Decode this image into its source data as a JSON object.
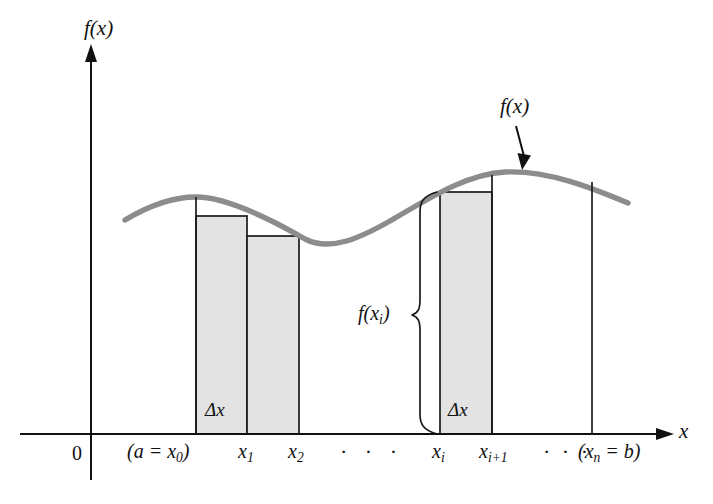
{
  "figure": {
    "width": 713,
    "height": 504,
    "background": "#ffffff"
  },
  "colors": {
    "curve": "#8c8c8c",
    "axis": "#111111",
    "rect_fill": "#e2e2e2",
    "rect_stroke": "#1a1a1a",
    "text": "#111111"
  },
  "axes": {
    "y_axis_label": "f(x)",
    "x_axis_label": "x",
    "origin_label": "0",
    "x_axis_y": 434,
    "y_axis_x": 91,
    "x_axis_start": 20,
    "x_axis_end": 672,
    "y_axis_top": 44,
    "y_axis_bottom": 480
  },
  "annotations": {
    "curve_label": "f(x)",
    "height_label_prefix": "f(x",
    "height_label_sub": "i",
    "height_label_suffix": ")",
    "delta_x_label_left": "Δx",
    "delta_x_label_right": "Δx"
  },
  "tick_labels": [
    {
      "id": "a-x0",
      "text_pre": "(a = x",
      "sub": "0",
      "text_post": ")",
      "x": 127
    },
    {
      "id": "x1",
      "text_pre": "x",
      "sub": "1",
      "text_post": "",
      "x": 238
    },
    {
      "id": "x2",
      "text_pre": "x",
      "sub": "2",
      "text_post": "",
      "x": 288
    },
    {
      "id": "dots-mid",
      "text_pre": "· · ·",
      "sub": "",
      "text_post": "",
      "x": 340
    },
    {
      "id": "xi",
      "text_pre": "x",
      "sub": "i",
      "text_post": "",
      "x": 432
    },
    {
      "id": "xi-plus-1",
      "text_pre": "x",
      "sub": "i+1",
      "text_post": "",
      "x": 479
    },
    {
      "id": "dots-right",
      "text_pre": "· · ·",
      "sub": "",
      "text_post": "",
      "x": 543
    },
    {
      "id": "xn-b",
      "text_pre": "(x",
      "sub": "n",
      "text_post": " = b)",
      "x": 578
    }
  ],
  "chart_data": {
    "type": "area",
    "xlabel": "x",
    "ylabel": "f(x)",
    "grid": false,
    "legend": "none",
    "curve_description": "Smooth wave: rises to a local maximum near x1, dips to a local minimum between x2 and xi, then rises to a global maximum near xi+1 and falls off to the right edge",
    "curve_points_px": [
      [
        125,
        220
      ],
      [
        150,
        206
      ],
      [
        175,
        199
      ],
      [
        196,
        197
      ],
      [
        220,
        199
      ],
      [
        250,
        212
      ],
      [
        280,
        230
      ],
      [
        305,
        239
      ],
      [
        325,
        241
      ],
      [
        350,
        238
      ],
      [
        380,
        228
      ],
      [
        410,
        211
      ],
      [
        440,
        193
      ],
      [
        470,
        180
      ],
      [
        500,
        173
      ],
      [
        530,
        172
      ],
      [
        560,
        178
      ],
      [
        590,
        188
      ],
      [
        612,
        197
      ],
      [
        628,
        203
      ]
    ],
    "rectangles": [
      {
        "id": "rect-1",
        "label": "Δx",
        "x_left_px": 196,
        "x_right_px": 247,
        "top_px": 216,
        "bottom_px": 434,
        "filled": true
      },
      {
        "id": "rect-2",
        "label": "Δx",
        "x_left_px": 247,
        "x_right_px": 299,
        "top_px": 236,
        "bottom_px": 434,
        "filled": true
      },
      {
        "id": "rect-i",
        "label": "Δx",
        "x_left_px": 440,
        "x_right_px": 492,
        "top_px": 192,
        "bottom_px": 434,
        "filled": true
      }
    ],
    "partition_lines_px": [
      {
        "id": "line-x0",
        "x": 196,
        "top": 197,
        "bottom": 434
      },
      {
        "id": "line-xi-plus-1",
        "x": 492,
        "top": 176,
        "bottom": 434
      },
      {
        "id": "line-xn",
        "x": 592,
        "top": 183,
        "bottom": 434
      }
    ],
    "brace": {
      "label": "f(x_i)",
      "x_px": 416,
      "top_px": 192,
      "bottom_px": 434,
      "mid_px": 315
    },
    "curve_arrow": {
      "label": "f(x)",
      "from_px": [
        516,
        126
      ],
      "to_px": [
        524,
        166
      ]
    }
  }
}
